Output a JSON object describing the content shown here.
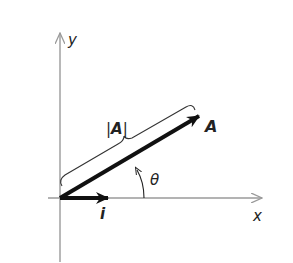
{
  "diagram": {
    "title": "",
    "axes": {
      "x_label": "x",
      "y_label": "y",
      "color": "#9a9a9a"
    },
    "vectors": {
      "A": {
        "label": "A",
        "color": "#111111"
      },
      "i": {
        "label": "i",
        "color": "#111111"
      }
    },
    "magnitude_label": {
      "left": "|",
      "sym": "A",
      "right": "|"
    },
    "angle_label": "θ"
  }
}
